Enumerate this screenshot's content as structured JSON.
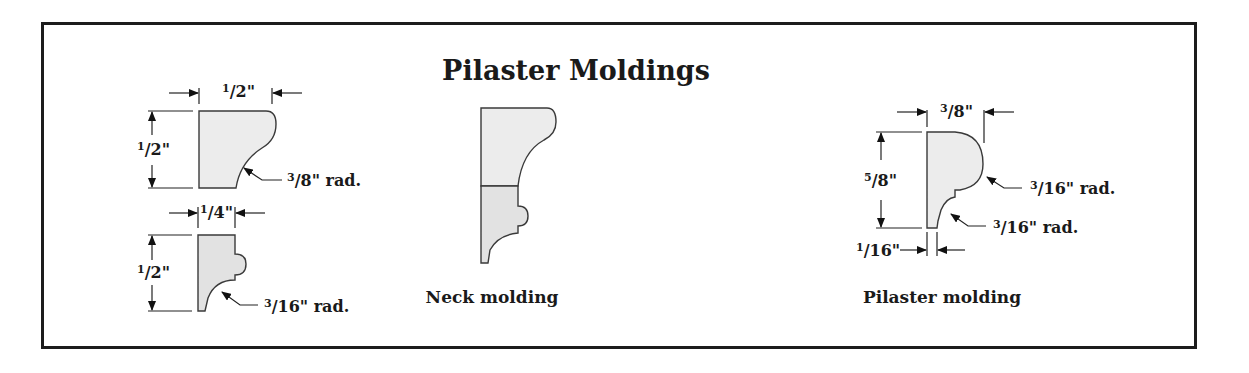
{
  "title": "Pilaster Moldings",
  "colors": {
    "border": "#1c1c1c",
    "profile_fill": "#ececec",
    "text": "#1a1a1a"
  },
  "profiles": [
    {
      "id": "cap-molding",
      "dimensions": {
        "width": {
          "num": "1",
          "den": "2",
          "unit": "\""
        },
        "height": {
          "num": "1",
          "den": "2",
          "unit": "\""
        },
        "radius": {
          "num": "3",
          "den": "8",
          "unit": "\"",
          "suffix": "rad."
        }
      }
    },
    {
      "id": "bead-molding",
      "dimensions": {
        "width": {
          "num": "1",
          "den": "4",
          "unit": "\""
        },
        "height": {
          "num": "1",
          "den": "2",
          "unit": "\""
        },
        "radius": {
          "num": "3",
          "den": "16",
          "unit": "\"",
          "suffix": "rad."
        }
      }
    },
    {
      "id": "neck-molding",
      "caption": "Neck molding"
    },
    {
      "id": "pilaster-molding",
      "caption": "Pilaster molding",
      "dimensions": {
        "width": {
          "num": "3",
          "den": "8",
          "unit": "\""
        },
        "height": {
          "num": "5",
          "den": "8",
          "unit": "\""
        },
        "upper_radius": {
          "num": "3",
          "den": "16",
          "unit": "\"",
          "suffix": "rad."
        },
        "lower_radius": {
          "num": "3",
          "den": "16",
          "unit": "\"",
          "suffix": "rad."
        },
        "offset": {
          "num": "1",
          "den": "16",
          "unit": "\""
        }
      }
    }
  ]
}
